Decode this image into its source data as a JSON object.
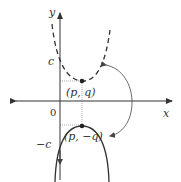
{
  "diagram": {
    "axes": {
      "x_label": "x",
      "y_label": "y",
      "origin_label": "0"
    },
    "intercepts": {
      "upper": "c",
      "lower": "−c"
    },
    "points": [
      {
        "label": "(p, q)",
        "role": "vertex-of-original"
      },
      {
        "label": "(p, −q)",
        "role": "vertex-of-reflection"
      }
    ],
    "curves": [
      {
        "name": "original-parabola",
        "style": "dashed",
        "opens": "up"
      },
      {
        "name": "reflected-parabola",
        "style": "solid",
        "opens": "down"
      }
    ],
    "annotation": "curved double-headed arrow indicating reflection across x-axis",
    "colors": {
      "stroke": "#333333",
      "guide": "#666666",
      "background": "#ffffff"
    }
  }
}
